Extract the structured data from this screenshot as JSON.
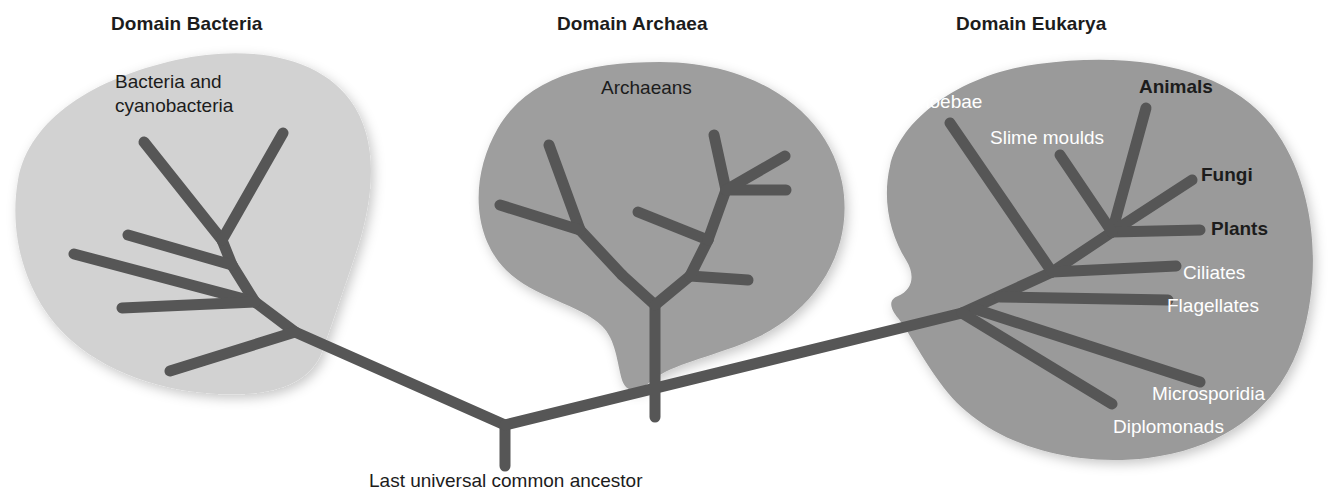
{
  "figure": {
    "kind": "phylogenetic-tree",
    "background_color": "#ffffff",
    "branch_color": "#565656",
    "root_label": "Last universal common ancestor"
  },
  "domains": [
    {
      "id": "bacteria",
      "title": "Domain Bacteria",
      "blob_color": "#d2d2d2",
      "group_label": "Bacteria and\ncyanobacteria",
      "group_label_line1": "Bacteria and",
      "group_label_line2": "cyanobacteria"
    },
    {
      "id": "archaea",
      "title": "Domain Archaea",
      "blob_color": "#9e9e9e",
      "group_label": "Archaeans"
    },
    {
      "id": "eukarya",
      "title": "Domain Eukarya",
      "blob_color": "#9a9a9a"
    }
  ],
  "eukarya_taxa": [
    {
      "label": "Amoebae",
      "style": "white"
    },
    {
      "label": "Slime moulds",
      "style": "white"
    },
    {
      "label": "Animals",
      "style": "dark-bold"
    },
    {
      "label": "Fungi",
      "style": "dark-bold"
    },
    {
      "label": "Plants",
      "style": "dark-bold"
    },
    {
      "label": "Ciliates",
      "style": "white"
    },
    {
      "label": "Flagellates",
      "style": "white"
    },
    {
      "label": "Microsporidia",
      "style": "white"
    },
    {
      "label": "Diplomonads",
      "style": "white"
    }
  ]
}
